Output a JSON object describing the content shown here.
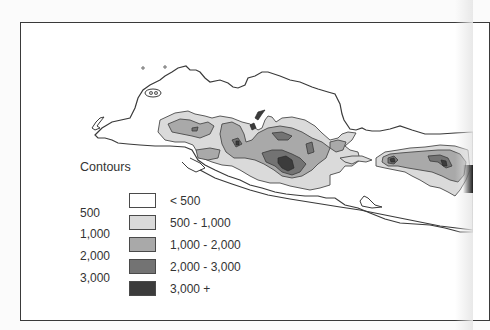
{
  "legend": {
    "title": "Contours",
    "contour_values": [
      "500",
      "1,000",
      "2,000",
      "3,000"
    ],
    "classes": [
      {
        "label": "< 500",
        "color": "#ffffff"
      },
      {
        "label": "500 - 1,000",
        "color": "#dadada"
      },
      {
        "label": "1,000 - 2,000",
        "color": "#a9a9a9"
      },
      {
        "label": "2,000 - 3,000",
        "color": "#737373"
      },
      {
        "label": "3,000 +",
        "color": "#3c3c3c"
      }
    ]
  },
  "colors": {
    "coastline": "#3a3a3a",
    "frame": "#3a3a3a",
    "text": "#333333"
  }
}
